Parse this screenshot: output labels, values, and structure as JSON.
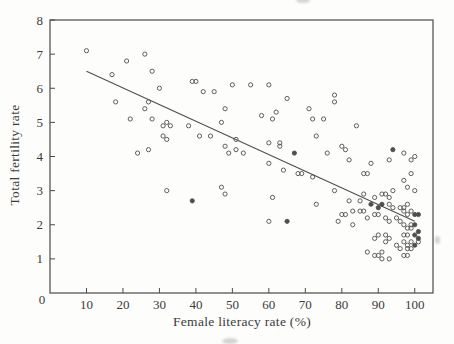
{
  "chart_data": {
    "type": "scatter",
    "title": "",
    "xlabel": "Female literacy rate (%)",
    "ylabel": "Total fertility rate",
    "xlim": [
      0,
      105
    ],
    "ylim": [
      0,
      8
    ],
    "x_ticks": [
      0,
      10,
      20,
      30,
      40,
      50,
      60,
      70,
      80,
      90,
      100
    ],
    "y_ticks": [
      0,
      1,
      2,
      3,
      4,
      5,
      6,
      7,
      8
    ],
    "origin_label": "0",
    "grid": false,
    "frame": "box",
    "legend": "none",
    "marker": "open-circle",
    "marker_radius": 2.1,
    "colors": {
      "background": "#fdfdfc",
      "axis": "#4a4a48",
      "marker": "#4e4e4c",
      "trend_line": "#4e4e4c",
      "text": "#3b3b3b"
    },
    "trend_line": {
      "x1": 10,
      "y1": 6.5,
      "x2": 100,
      "y2": 2.1
    },
    "points": [
      [
        10,
        7.1
      ],
      [
        21,
        6.8
      ],
      [
        26,
        7.0
      ],
      [
        28,
        6.5
      ],
      [
        17,
        6.4
      ],
      [
        30,
        6.0
      ],
      [
        18,
        5.6
      ],
      [
        27,
        5.6
      ],
      [
        26,
        5.4
      ],
      [
        22,
        5.1
      ],
      [
        28,
        5.1
      ],
      [
        32,
        5.0
      ],
      [
        31,
        4.9
      ],
      [
        33,
        4.9
      ],
      [
        31,
        4.6
      ],
      [
        32,
        4.5
      ],
      [
        27,
        4.2
      ],
      [
        24,
        4.1
      ],
      [
        39,
        6.2
      ],
      [
        40,
        6.2
      ],
      [
        50,
        6.1
      ],
      [
        55,
        6.1
      ],
      [
        60,
        6.1
      ],
      [
        42,
        5.9
      ],
      [
        45,
        5.9
      ],
      [
        65,
        5.7
      ],
      [
        48,
        5.4
      ],
      [
        58,
        5.2
      ],
      [
        62,
        5.3
      ],
      [
        61,
        5.1
      ],
      [
        47,
        5.0
      ],
      [
        38,
        4.9
      ],
      [
        41,
        4.6
      ],
      [
        44,
        4.6
      ],
      [
        51,
        4.5
      ],
      [
        48,
        4.3
      ],
      [
        51,
        4.2
      ],
      [
        60,
        4.4
      ],
      [
        63,
        4.4
      ],
      [
        63,
        4.3
      ],
      [
        53,
        4.1
      ],
      [
        49,
        4.1
      ],
      [
        78,
        5.8
      ],
      [
        78,
        5.6
      ],
      [
        71,
        5.4
      ],
      [
        72,
        5.1
      ],
      [
        75,
        5.1
      ],
      [
        84,
        4.9
      ],
      [
        73,
        4.6
      ],
      [
        80,
        4.3
      ],
      [
        81,
        4.2
      ],
      [
        76,
        4.1
      ],
      [
        97,
        4.1
      ],
      [
        100,
        4.0
      ],
      [
        93,
        3.9
      ],
      [
        32,
        3.0
      ],
      [
        60,
        3.8
      ],
      [
        64,
        3.6
      ],
      [
        68,
        3.5
      ],
      [
        69,
        3.5
      ],
      [
        47,
        3.1
      ],
      [
        48,
        2.9
      ],
      [
        61,
        2.8
      ],
      [
        60,
        2.1
      ],
      [
        82,
        3.9
      ],
      [
        88,
        3.8
      ],
      [
        99,
        3.9
      ],
      [
        86,
        3.5
      ],
      [
        87,
        3.5
      ],
      [
        72,
        3.4
      ],
      [
        99,
        3.5
      ],
      [
        97,
        3.3
      ],
      [
        98,
        3.1
      ],
      [
        78,
        3.0
      ],
      [
        94,
        3.0
      ],
      [
        100,
        3.0
      ],
      [
        86,
        2.9
      ],
      [
        89,
        2.8
      ],
      [
        91,
        2.9
      ],
      [
        92,
        2.9
      ],
      [
        93,
        2.8
      ],
      [
        85,
        2.7
      ],
      [
        82,
        2.7
      ],
      [
        73,
        2.6
      ],
      [
        93,
        2.6
      ],
      [
        94,
        2.5
      ],
      [
        96,
        2.5
      ],
      [
        97,
        2.5
      ],
      [
        98,
        2.6
      ],
      [
        99,
        2.4
      ],
      [
        85,
        2.4
      ],
      [
        86,
        2.4
      ],
      [
        83,
        2.4
      ],
      [
        80,
        2.3
      ],
      [
        81,
        2.3
      ],
      [
        89,
        2.3
      ],
      [
        90,
        2.3
      ],
      [
        97,
        2.4
      ],
      [
        98,
        2.3
      ],
      [
        87,
        2.2
      ],
      [
        92,
        2.2
      ],
      [
        93,
        2.1
      ],
      [
        95,
        2.2
      ],
      [
        96,
        2.1
      ],
      [
        79,
        2.1
      ],
      [
        83,
        2.0
      ],
      [
        97,
        2.0
      ],
      [
        98,
        1.9
      ],
      [
        99,
        2.0
      ],
      [
        99,
        1.9
      ],
      [
        92,
        1.7
      ],
      [
        93,
        1.6
      ],
      [
        89,
        1.6
      ],
      [
        97,
        1.7
      ],
      [
        98,
        1.7
      ],
      [
        90,
        1.7
      ],
      [
        97,
        1.5
      ],
      [
        98,
        1.4
      ],
      [
        99,
        1.5
      ],
      [
        101,
        1.5
      ],
      [
        92,
        1.5
      ],
      [
        95,
        1.4
      ],
      [
        96,
        1.3
      ],
      [
        98,
        1.3
      ],
      [
        99,
        1.3
      ],
      [
        91,
        1.2
      ],
      [
        87,
        1.2
      ],
      [
        89,
        1.1
      ],
      [
        97,
        1.1
      ],
      [
        98,
        1.1
      ],
      [
        90,
        1.1
      ],
      [
        91,
        1.0
      ],
      [
        93,
        1.0
      ]
    ],
    "points_emphasized": [
      [
        67,
        4.1
      ],
      [
        94,
        4.2
      ],
      [
        39,
        2.7
      ],
      [
        65,
        2.1
      ],
      [
        91,
        2.6
      ],
      [
        90,
        2.5
      ],
      [
        88,
        2.6
      ],
      [
        100,
        2.3
      ],
      [
        101,
        2.3
      ],
      [
        100,
        2.0
      ],
      [
        101,
        1.8
      ],
      [
        100,
        1.7
      ],
      [
        101,
        1.6
      ],
      [
        100,
        1.4
      ]
    ]
  }
}
